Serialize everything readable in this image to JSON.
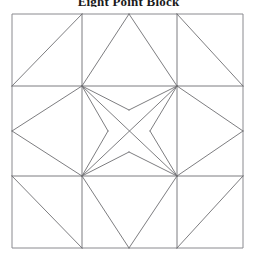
{
  "document": {
    "title": "Eight Point Block",
    "title_visible_fragment": "Eight Point Block"
  },
  "figure": {
    "name": "quilt-block-line-drawing",
    "background_color": "#ffffff",
    "line_color": "#6e6e72",
    "frame_color": "#8a8a8f",
    "line_width": 0.9
  },
  "chart_data": {
    "type": "diagram",
    "title": "Eight Point Block",
    "subtype": "quilt-block-patchwork-geometry",
    "canvas": {
      "width": 257,
      "height": 265
    },
    "block_bounds": {
      "x0": 12,
      "y0": 14,
      "x1": 243,
      "y1": 248
    },
    "grid": {
      "x_divisions": [
        12,
        82,
        177,
        243
      ],
      "y_divisions": [
        14,
        86,
        176,
        248
      ],
      "columns": 3,
      "rows": 3
    },
    "key_points": {
      "TL": [
        12,
        14
      ],
      "TM1": [
        82,
        14
      ],
      "TM2": [
        177,
        14
      ],
      "TR": [
        243,
        14
      ],
      "ML1_L": [
        12,
        86
      ],
      "C_TL": [
        82,
        86
      ],
      "C_TR": [
        177,
        86
      ],
      "ML1_R": [
        243,
        86
      ],
      "MIDL": [
        12,
        131
      ],
      "MIDR": [
        243,
        131
      ],
      "ML2_L": [
        12,
        176
      ],
      "C_BL": [
        82,
        176
      ],
      "C_BR": [
        177,
        176
      ],
      "ML2_R": [
        243,
        176
      ],
      "BL": [
        12,
        248
      ],
      "BM1": [
        82,
        248
      ],
      "BM2": [
        177,
        248
      ],
      "BR": [
        243,
        248
      ],
      "TOP_APEX": [
        129,
        14
      ],
      "BOT_APEX": [
        129,
        248
      ],
      "CEN_UP": [
        129,
        110
      ],
      "CEN_DN": [
        129,
        152
      ],
      "CEN_LF": [
        108,
        131
      ],
      "CEN_RT": [
        150,
        131
      ]
    },
    "segments": [
      {
        "name": "frame-top",
        "from": [
          12,
          14
        ],
        "to": [
          243,
          14
        ]
      },
      {
        "name": "frame-right",
        "from": [
          243,
          14
        ],
        "to": [
          243,
          248
        ]
      },
      {
        "name": "frame-bottom",
        "from": [
          243,
          248
        ],
        "to": [
          12,
          248
        ]
      },
      {
        "name": "frame-left",
        "from": [
          12,
          248
        ],
        "to": [
          12,
          14
        ]
      },
      {
        "name": "grid-vert-left",
        "from": [
          82,
          14
        ],
        "to": [
          82,
          248
        ]
      },
      {
        "name": "grid-vert-right",
        "from": [
          177,
          14
        ],
        "to": [
          177,
          248
        ]
      },
      {
        "name": "grid-horiz-top",
        "from": [
          12,
          86
        ],
        "to": [
          243,
          86
        ]
      },
      {
        "name": "grid-horiz-bottom",
        "from": [
          12,
          176
        ],
        "to": [
          243,
          176
        ]
      },
      {
        "name": "corner-tl-diagonal",
        "from": [
          12,
          86
        ],
        "to": [
          82,
          14
        ]
      },
      {
        "name": "corner-tr-diagonal",
        "from": [
          177,
          14
        ],
        "to": [
          243,
          86
        ]
      },
      {
        "name": "corner-bl-diagonal",
        "from": [
          12,
          176
        ],
        "to": [
          82,
          248
        ]
      },
      {
        "name": "corner-br-diagonal",
        "from": [
          177,
          248
        ],
        "to": [
          243,
          176
        ]
      },
      {
        "name": "top-star-point-left",
        "from": [
          82,
          86
        ],
        "to": [
          129,
          14
        ]
      },
      {
        "name": "top-star-point-right",
        "from": [
          129,
          14
        ],
        "to": [
          177,
          86
        ]
      },
      {
        "name": "bottom-star-point-left",
        "from": [
          82,
          176
        ],
        "to": [
          129,
          248
        ]
      },
      {
        "name": "bottom-star-point-right",
        "from": [
          129,
          248
        ],
        "to": [
          177,
          176
        ]
      },
      {
        "name": "left-diamond-upper",
        "from": [
          82,
          86
        ],
        "to": [
          12,
          131
        ]
      },
      {
        "name": "left-diamond-lower",
        "from": [
          12,
          131
        ],
        "to": [
          82,
          176
        ]
      },
      {
        "name": "right-diamond-upper",
        "from": [
          177,
          86
        ],
        "to": [
          243,
          131
        ]
      },
      {
        "name": "right-diamond-lower",
        "from": [
          243,
          131
        ],
        "to": [
          177,
          176
        ]
      },
      {
        "name": "center-cross-tl-br",
        "from": [
          82,
          86
        ],
        "to": [
          177,
          176
        ]
      },
      {
        "name": "center-cross-tr-bl",
        "from": [
          177,
          86
        ],
        "to": [
          82,
          176
        ]
      },
      {
        "name": "center-star-tl-up",
        "from": [
          82,
          86
        ],
        "to": [
          129,
          110
        ]
      },
      {
        "name": "center-star-tr-up",
        "from": [
          177,
          86
        ],
        "to": [
          129,
          110
        ]
      },
      {
        "name": "center-star-bl-dn",
        "from": [
          82,
          176
        ],
        "to": [
          129,
          152
        ]
      },
      {
        "name": "center-star-br-dn",
        "from": [
          177,
          176
        ],
        "to": [
          129,
          152
        ]
      },
      {
        "name": "center-star-tl-lf",
        "from": [
          82,
          86
        ],
        "to": [
          108,
          131
        ]
      },
      {
        "name": "center-star-bl-lf",
        "from": [
          82,
          176
        ],
        "to": [
          108,
          131
        ]
      },
      {
        "name": "center-star-tr-rt",
        "from": [
          177,
          86
        ],
        "to": [
          150,
          131
        ]
      },
      {
        "name": "center-star-br-rt",
        "from": [
          177,
          176
        ],
        "to": [
          150,
          131
        ]
      }
    ],
    "xlabel": "",
    "ylabel": "",
    "grid_on": false,
    "legend": []
  }
}
